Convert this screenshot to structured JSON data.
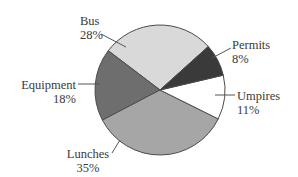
{
  "chart_data": {
    "type": "pie",
    "title": "",
    "title_note": "title cropped at top edge, illegible",
    "start_angle_deg": 42,
    "direction": "counterclockwise",
    "categories": [
      "Bus",
      "Equipment",
      "Lunches",
      "Umpires",
      "Permits"
    ],
    "values": [
      28,
      18,
      35,
      11,
      8
    ],
    "unit": "%",
    "colors": [
      "#d9d9d9",
      "#6e6e6e",
      "#a6a6a6",
      "#ffffff",
      "#3a3a3a"
    ],
    "legend": "none (direct labels with leader lines)"
  },
  "labels": {
    "bus": {
      "name": "Bus",
      "pct": "28%"
    },
    "equipment": {
      "name": "Equipment",
      "pct": "18%"
    },
    "lunches": {
      "name": "Lunches",
      "pct": "35%"
    },
    "umpires": {
      "name": "Umpires",
      "pct": "11%"
    },
    "permits": {
      "name": "Permits",
      "pct": "8%"
    }
  },
  "style": {
    "outline_color": "#4a4a4a",
    "leader_color": "#555555"
  }
}
